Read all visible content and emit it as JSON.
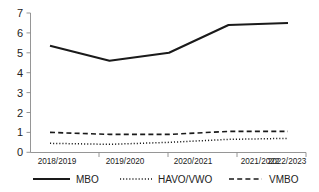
{
  "chart_data": {
    "type": "line",
    "title": "",
    "subtitle": "",
    "xlabel": "",
    "ylabel": "",
    "categories": [
      "2018/2019",
      "2019/2020",
      "2020/2021",
      "2021/2022",
      "2022/2023"
    ],
    "series": [
      {
        "name": "MBO",
        "style": "solid",
        "values": [
          5.35,
          4.6,
          5.0,
          6.4,
          6.5
        ]
      },
      {
        "name": "HAVO/VWO",
        "style": "dotted",
        "values": [
          0.45,
          0.4,
          0.5,
          0.65,
          0.7
        ]
      },
      {
        "name": "VMBO",
        "style": "dashed",
        "values": [
          1.0,
          0.9,
          0.9,
          1.05,
          1.05
        ]
      }
    ],
    "ylim": [
      0,
      7
    ],
    "yticks": [
      0,
      1,
      2,
      3,
      4,
      5,
      6,
      7
    ],
    "ytick_labels": [
      "0",
      "1",
      "2",
      "3",
      "4",
      "5",
      "6",
      "7"
    ],
    "xlim": [
      0,
      4
    ],
    "grid": false,
    "legend_position": "bottom",
    "colors": {
      "line": "#1a1a1a",
      "axis": "#8a8a8a",
      "text": "#222222",
      "background": "#ffffff"
    }
  },
  "legend": {
    "entries": [
      {
        "label": "MBO",
        "swatch": "solid-line-swatch"
      },
      {
        "label": "HAVO/VWO",
        "swatch": "dotted-line-swatch"
      },
      {
        "label": "VMBO",
        "swatch": "dashed-line-swatch"
      }
    ]
  },
  "axes": {
    "y": {
      "labels": [
        "7",
        "6",
        "5",
        "4",
        "3",
        "2",
        "1",
        "0"
      ]
    },
    "x": {
      "labels": [
        "2018/2019",
        "2019/2020",
        "2020/2021",
        "2021/2022",
        "2022/2023"
      ]
    }
  }
}
